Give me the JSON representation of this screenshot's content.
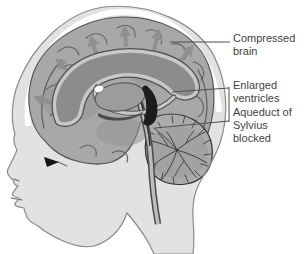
{
  "figure": {
    "labels": [
      {
        "text": "Compressed\nbrain"
      },
      {
        "text": "Enlarged\nventricles"
      },
      {
        "text": "Aqueduct of\nSylvius\nblocked"
      }
    ]
  },
  "colors": {
    "background": "#ffffff",
    "skin": "#e2e2e2",
    "skull_band": "#ffffff",
    "brain": "#a8a8a8",
    "brain_shade": "#949494",
    "arrow": "#8e8e8e",
    "ventricle": "#8c8c8c",
    "ventricle_band": "#c8c8c8",
    "thalamus": "#9c9c9c",
    "blocked": "#1c1c1c",
    "cerebellum": "#ababab",
    "outline": "#4f4f4f",
    "outline_head": "#8b8b8b",
    "leader_line": "#4f4f4f",
    "label_text": "#3f3f3f"
  }
}
